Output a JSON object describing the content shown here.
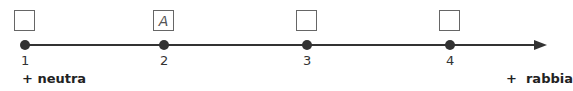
{
  "diagram": {
    "type": "scale",
    "points": [
      {
        "x": 25,
        "number": "1",
        "box_mark": ""
      },
      {
        "x": 164,
        "number": "2",
        "box_mark": "A"
      },
      {
        "x": 307,
        "number": "3",
        "box_mark": ""
      },
      {
        "x": 450,
        "number": "4",
        "box_mark": ""
      }
    ],
    "left_label": "+ neutra",
    "right_label": "+  rabbia"
  }
}
